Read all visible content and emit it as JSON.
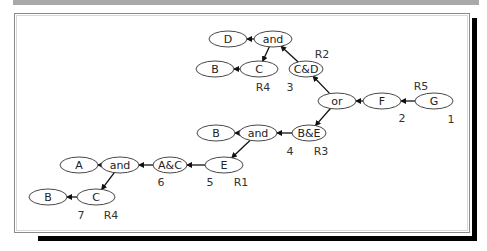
{
  "diagram": {
    "nodes": [
      {
        "id": "n_D",
        "label": "D",
        "x": 228,
        "y": 39,
        "rx": 19
      },
      {
        "id": "n_and1",
        "label": "and",
        "x": 273,
        "y": 39,
        "rx": 19
      },
      {
        "id": "n_B1",
        "label": "B",
        "x": 215,
        "y": 69,
        "rx": 19
      },
      {
        "id": "n_C1",
        "label": "C",
        "x": 259,
        "y": 69,
        "rx": 19
      },
      {
        "id": "n_CD",
        "label": "C&D",
        "x": 306,
        "y": 69,
        "rx": 17
      },
      {
        "id": "n_or",
        "label": "or",
        "x": 337,
        "y": 101,
        "rx": 19
      },
      {
        "id": "n_F",
        "label": "F",
        "x": 382,
        "y": 101,
        "rx": 19
      },
      {
        "id": "n_G",
        "label": "G",
        "x": 434,
        "y": 101,
        "rx": 19
      },
      {
        "id": "n_B2",
        "label": "B",
        "x": 216,
        "y": 133,
        "rx": 19
      },
      {
        "id": "n_and2",
        "label": "and",
        "x": 258,
        "y": 133,
        "rx": 19
      },
      {
        "id": "n_BE",
        "label": "B&E",
        "x": 309,
        "y": 133,
        "rx": 17
      },
      {
        "id": "n_A",
        "label": "A",
        "x": 79,
        "y": 165,
        "rx": 19
      },
      {
        "id": "n_and3",
        "label": "and",
        "x": 120,
        "y": 165,
        "rx": 19
      },
      {
        "id": "n_AC",
        "label": "A&C",
        "x": 170,
        "y": 165,
        "rx": 17
      },
      {
        "id": "n_E",
        "label": "E",
        "x": 224,
        "y": 165,
        "rx": 19
      },
      {
        "id": "n_B3",
        "label": "B",
        "x": 48,
        "y": 197,
        "rx": 19
      },
      {
        "id": "n_C2",
        "label": "C",
        "x": 96,
        "y": 197,
        "rx": 19
      }
    ],
    "edges": [
      {
        "from": "n_and1",
        "to": "n_D"
      },
      {
        "from": "n_and1",
        "to": "n_C1"
      },
      {
        "from": "n_C1",
        "to": "n_B1"
      },
      {
        "from": "n_CD",
        "to": "n_and1"
      },
      {
        "from": "n_or",
        "to": "n_CD"
      },
      {
        "from": "n_or",
        "to": "n_BE"
      },
      {
        "from": "n_F",
        "to": "n_or"
      },
      {
        "from": "n_G",
        "to": "n_F"
      },
      {
        "from": "n_BE",
        "to": "n_and2"
      },
      {
        "from": "n_and2",
        "to": "n_B2"
      },
      {
        "from": "n_and2",
        "to": "n_E"
      },
      {
        "from": "n_E",
        "to": "n_AC"
      },
      {
        "from": "n_AC",
        "to": "n_and3"
      },
      {
        "from": "n_and3",
        "to": "n_A"
      },
      {
        "from": "n_and3",
        "to": "n_C2"
      },
      {
        "from": "n_C2",
        "to": "n_B3"
      }
    ],
    "annotations": [
      {
        "text": "R2",
        "x": 322,
        "y": 54
      },
      {
        "text": "R4",
        "x": 263,
        "y": 87
      },
      {
        "text": "3",
        "x": 290,
        "y": 87
      },
      {
        "text": "R5",
        "x": 421,
        "y": 86
      },
      {
        "text": "2",
        "x": 402,
        "y": 118
      },
      {
        "text": "1",
        "x": 451,
        "y": 119
      },
      {
        "text": "4",
        "x": 290,
        "y": 151
      },
      {
        "text": "R3",
        "x": 321,
        "y": 151
      },
      {
        "text": "6",
        "x": 161,
        "y": 182
      },
      {
        "text": "5",
        "x": 210,
        "y": 182
      },
      {
        "text": "R1",
        "x": 241,
        "y": 182
      },
      {
        "text": "7",
        "x": 81,
        "y": 215
      },
      {
        "text": "R4",
        "x": 111,
        "y": 215
      }
    ]
  }
}
